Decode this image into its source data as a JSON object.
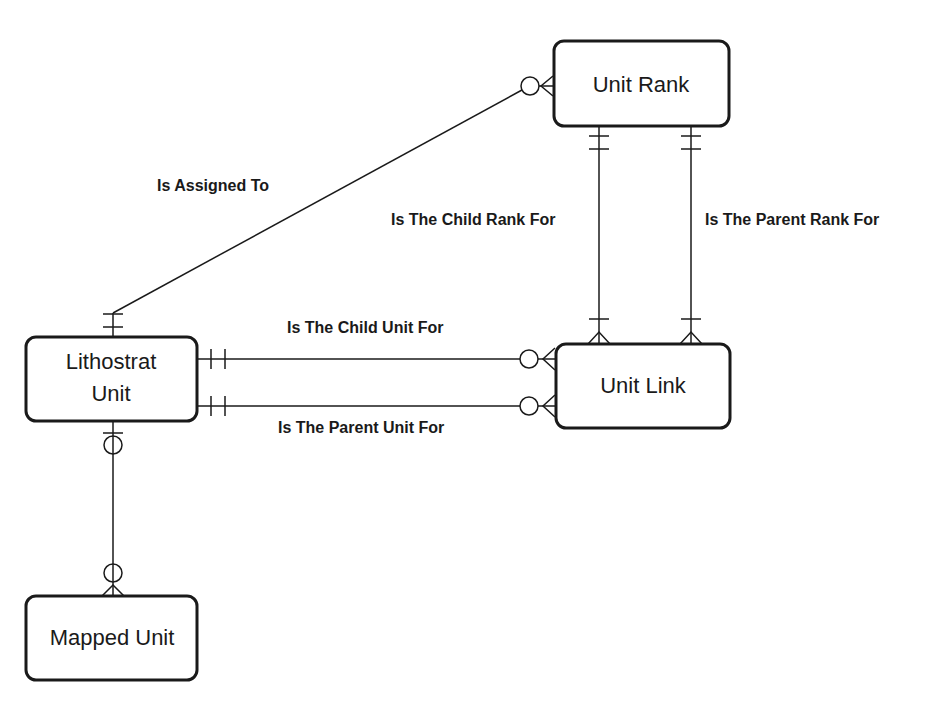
{
  "diagram": {
    "type": "entity-relationship",
    "notation": "crows-foot",
    "entities": [
      {
        "id": "unit_rank",
        "label": "Unit Rank"
      },
      {
        "id": "lithostrat_unit",
        "label_line1": "Lithostrat",
        "label_line2": "Unit"
      },
      {
        "id": "unit_link",
        "label": "Unit Link"
      },
      {
        "id": "mapped_unit",
        "label": "Mapped Unit"
      }
    ],
    "relationships": [
      {
        "id": "is_assigned_to",
        "label": "Is Assigned To",
        "from": "lithostrat_unit",
        "to": "unit_rank",
        "from_cardinality": "one-and-only-one",
        "to_cardinality": "zero-or-many"
      },
      {
        "id": "is_the_child_rank_for",
        "label": "Is The Child Rank For",
        "from": "unit_rank",
        "to": "unit_link",
        "from_cardinality": "one-and-only-one",
        "to_cardinality": "one-or-many"
      },
      {
        "id": "is_the_parent_rank_for",
        "label": "Is The Parent Rank For",
        "from": "unit_rank",
        "to": "unit_link",
        "from_cardinality": "one-and-only-one",
        "to_cardinality": "one-or-many"
      },
      {
        "id": "is_the_child_unit_for",
        "label": "Is The Child Unit For",
        "from": "lithostrat_unit",
        "to": "unit_link",
        "from_cardinality": "one-and-only-one",
        "to_cardinality": "zero-or-many"
      },
      {
        "id": "is_the_parent_unit_for",
        "label": "Is The Parent Unit For",
        "from": "lithostrat_unit",
        "to": "unit_link",
        "from_cardinality": "one-and-only-one",
        "to_cardinality": "zero-or-many"
      },
      {
        "id": "lithostrat_to_mapped",
        "label": "",
        "from": "lithostrat_unit",
        "to": "mapped_unit",
        "from_cardinality": "zero-or-one",
        "to_cardinality": "zero-or-many"
      }
    ]
  }
}
